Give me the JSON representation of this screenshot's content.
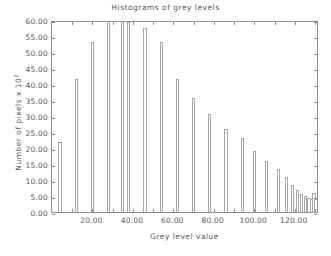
{
  "chart_data": {
    "type": "bar",
    "title": "Histograms of grey levels",
    "xlabel": "Grey level value",
    "ylabel_text": "Number of  pixels  x 10",
    "ylabel_exp": "2",
    "xlim": [
      0,
      132
    ],
    "ylim": [
      0,
      60
    ],
    "grid": false,
    "legend": null,
    "xticks": [
      20,
      40,
      60,
      80,
      100,
      120
    ],
    "xticklabels": [
      "20.00",
      "40.00",
      "60.00",
      "80.00",
      "100.00",
      "120.00"
    ],
    "yticks": [
      0,
      5,
      10,
      15,
      20,
      25,
      30,
      35,
      40,
      45,
      50,
      55,
      60
    ],
    "yticklabels": [
      "0.00",
      "5.00",
      "10.00",
      "15.00",
      "20.00",
      "25.00",
      "30.00",
      "35.00",
      "40.00",
      "45.00",
      "50.00",
      "55.00",
      "60.00"
    ],
    "bar_color": "#ffffff",
    "bar_edge_color": "#a6a6ab",
    "axis_color": "#8d8d92",
    "text_color": "#56565a",
    "x": [
      4.0,
      12.0,
      20.0,
      28.0,
      35.0,
      38.0,
      46.0,
      54.0,
      62.0,
      70.0,
      78.0,
      86.0,
      94.0,
      100.0,
      106.0,
      112.0,
      116.0,
      119.0,
      121.5,
      123.5,
      125.5,
      127.0,
      128.3,
      129.5,
      130.5
    ],
    "values": [
      22.0,
      41.5,
      53.0,
      60.0,
      60.0,
      59.5,
      57.5,
      53.0,
      41.5,
      35.5,
      30.5,
      26.0,
      23.0,
      19.0,
      16.0,
      13.5,
      11.0,
      8.5,
      7.0,
      5.5,
      5.0,
      4.5,
      4.0,
      6.0,
      4.0
    ],
    "bar_width": 1.6
  }
}
